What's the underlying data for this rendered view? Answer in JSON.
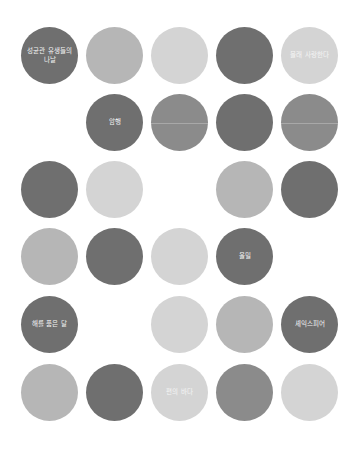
{
  "grid": {
    "rows": 6,
    "cols": 5,
    "cells": [
      {
        "row": 0,
        "col": 0,
        "shade": "dark",
        "label": "성균관 유생들의 나날"
      },
      {
        "row": 0,
        "col": 1,
        "shade": "light",
        "label": ""
      },
      {
        "row": 0,
        "col": 2,
        "shade": "pale",
        "label": ""
      },
      {
        "row": 0,
        "col": 3,
        "shade": "dark",
        "label": ""
      },
      {
        "row": 0,
        "col": 4,
        "shade": "pale",
        "label": "몰래 사랑한다"
      },
      {
        "row": 1,
        "col": 1,
        "shade": "dark",
        "label": "암행"
      },
      {
        "row": 1,
        "col": 2,
        "shade": "mid",
        "label": "",
        "seam": true
      },
      {
        "row": 1,
        "col": 3,
        "shade": "dark",
        "label": ""
      },
      {
        "row": 1,
        "col": 4,
        "shade": "mid",
        "label": "",
        "seam": true
      },
      {
        "row": 2,
        "col": 0,
        "shade": "dark",
        "label": ""
      },
      {
        "row": 2,
        "col": 1,
        "shade": "pale",
        "label": ""
      },
      {
        "row": 2,
        "col": 3,
        "shade": "light",
        "label": ""
      },
      {
        "row": 2,
        "col": 4,
        "shade": "dark",
        "label": ""
      },
      {
        "row": 3,
        "col": 0,
        "shade": "light",
        "label": ""
      },
      {
        "row": 3,
        "col": 1,
        "shade": "dark",
        "label": ""
      },
      {
        "row": 3,
        "col": 2,
        "shade": "pale",
        "label": ""
      },
      {
        "row": 3,
        "col": 3,
        "shade": "dark",
        "label": "울밀"
      },
      {
        "row": 4,
        "col": 0,
        "shade": "dark",
        "label": "해를 품은 달"
      },
      {
        "row": 4,
        "col": 2,
        "shade": "pale",
        "label": ""
      },
      {
        "row": 4,
        "col": 3,
        "shade": "light",
        "label": ""
      },
      {
        "row": 4,
        "col": 4,
        "shade": "dark",
        "label": "셰익스피어"
      },
      {
        "row": 5,
        "col": 0,
        "shade": "light",
        "label": ""
      },
      {
        "row": 5,
        "col": 1,
        "shade": "dark",
        "label": ""
      },
      {
        "row": 5,
        "col": 2,
        "shade": "pale",
        "label": "편의 바다"
      },
      {
        "row": 5,
        "col": 3,
        "shade": "mid",
        "label": ""
      },
      {
        "row": 5,
        "col": 4,
        "shade": "pale",
        "label": ""
      }
    ]
  },
  "colors": {
    "dark": "#6f6f6f",
    "mid": "#8b8b8b",
    "light": "#b6b6b6",
    "pale": "#d4d4d4",
    "background": "#ffffff"
  }
}
